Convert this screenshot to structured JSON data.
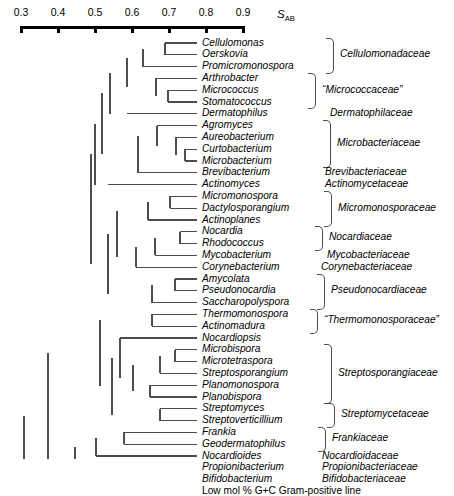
{
  "axis": {
    "label": "S",
    "label_sub": "AB",
    "ticks": [
      {
        "value": "0.3",
        "x": 21
      },
      {
        "value": "0.4",
        "x": 58
      },
      {
        "value": "0.5",
        "x": 95
      },
      {
        "value": "0.6",
        "x": 132
      },
      {
        "value": "0.7",
        "x": 169
      },
      {
        "value": "0.8",
        "x": 206
      },
      {
        "value": "0.9",
        "x": 243
      }
    ],
    "line_y": 26,
    "tick_label_y": 6
  },
  "chart_data": {
    "type": "dendrogram",
    "title": "",
    "xlabel": "S_AB",
    "xlim": [
      0.3,
      0.9
    ],
    "axis_direction": "decreasing-similarity-to-left",
    "grid": false,
    "legend": "none",
    "n_taxa": 35,
    "row_spacing": 11.8,
    "first_row_y": 43,
    "leaf_label_x": 202,
    "taxa": [
      {
        "name": "Cellulomonas",
        "row": 0,
        "branch_x": 165,
        "italic": true
      },
      {
        "name": "Oerskovia",
        "row": 1,
        "branch_x": 165,
        "italic": true
      },
      {
        "name": "Promicromonospora",
        "row": 2,
        "branch_x": 143,
        "italic": true
      },
      {
        "name": "Arthrobacter",
        "row": 3,
        "branch_x": 156,
        "italic": true
      },
      {
        "name": "Micrococcus",
        "row": 4,
        "branch_x": 168,
        "italic": true
      },
      {
        "name": "Stomatococcus",
        "row": 5,
        "branch_x": 168,
        "italic": true
      },
      {
        "name": "Dermatophilus",
        "row": 6,
        "branch_x": 127,
        "italic": true
      },
      {
        "name": "Agromyces",
        "row": 7,
        "branch_x": 157,
        "italic": true
      },
      {
        "name": "Aureobacterium",
        "row": 8,
        "branch_x": 176,
        "italic": true
      },
      {
        "name": "Curtobacterium",
        "row": 9,
        "branch_x": 185,
        "italic": true
      },
      {
        "name": "Microbacterium",
        "row": 10,
        "branch_x": 185,
        "italic": true
      },
      {
        "name": "Brevibacterium",
        "row": 11,
        "branch_x": 138,
        "italic": true
      },
      {
        "name": "Actinomyces",
        "row": 12,
        "branch_x": 108,
        "italic": true
      },
      {
        "name": "Micromonospora",
        "row": 13,
        "branch_x": 170,
        "italic": true
      },
      {
        "name": "Dactylosporangium",
        "row": 14,
        "branch_x": 170,
        "italic": true
      },
      {
        "name": "Actinoplanes",
        "row": 15,
        "branch_x": 148,
        "italic": true
      },
      {
        "name": "Nocardia",
        "row": 16,
        "branch_x": 180,
        "italic": true
      },
      {
        "name": "Rhodococcus",
        "row": 17,
        "branch_x": 180,
        "italic": true
      },
      {
        "name": "Mycobacterium",
        "row": 18,
        "branch_x": 155,
        "italic": true
      },
      {
        "name": "Corynebacterium",
        "row": 19,
        "branch_x": 136,
        "italic": true
      },
      {
        "name": "Amycolata",
        "row": 20,
        "branch_x": 175,
        "italic": true
      },
      {
        "name": "Pseudonocardia",
        "row": 21,
        "branch_x": 175,
        "italic": true
      },
      {
        "name": "Saccharopolyspora",
        "row": 22,
        "branch_x": 152,
        "italic": true
      },
      {
        "name": "Thermomonospora",
        "row": 23,
        "branch_x": 152,
        "italic": true
      },
      {
        "name": "Actinomadura",
        "row": 24,
        "branch_x": 152,
        "italic": true
      },
      {
        "name": "Nocardiopsis",
        "row": 25,
        "branch_x": 120,
        "italic": true
      },
      {
        "name": "Microbispora",
        "row": 26,
        "branch_x": 175,
        "italic": true
      },
      {
        "name": "Microtetraspora",
        "row": 27,
        "branch_x": 175,
        "italic": true
      },
      {
        "name": "Streptosporangium",
        "row": 28,
        "branch_x": 160,
        "italic": true
      },
      {
        "name": "Planomonospora",
        "row": 29,
        "branch_x": 150,
        "italic": true
      },
      {
        "name": "Planobispora",
        "row": 30,
        "branch_x": 150,
        "italic": true
      },
      {
        "name": "Streptomyces",
        "row": 31,
        "branch_x": 160,
        "italic": true
      },
      {
        "name": "Streptoverticillium",
        "row": 32,
        "branch_x": 160,
        "italic": true
      },
      {
        "name": "Frankia",
        "row": 33,
        "branch_x": 124,
        "italic": true
      },
      {
        "name": "Geodermatophilus",
        "row": 34,
        "branch_x": 124,
        "italic": true
      },
      {
        "name": "Nocardioides",
        "row": 35,
        "branch_x": 96,
        "italic": true
      },
      {
        "name": "Propionibacterium",
        "row": 36,
        "branch_x": 75,
        "italic": true
      },
      {
        "name": "Bifidobacterium",
        "row": 37,
        "branch_x": 48,
        "italic": true
      },
      {
        "name": "Low mol % G+C Gram-positive line",
        "row": 38,
        "branch_x": 24,
        "italic": false
      }
    ],
    "families": [
      {
        "label": "Cellulomonadaceae",
        "rows": [
          0,
          2
        ],
        "bracket": true,
        "quoted": false,
        "label_x": 340
      },
      {
        "label": "“Micrococcaceae”",
        "rows": [
          3,
          5
        ],
        "bracket": true,
        "quoted": true,
        "label_x": 322
      },
      {
        "label": "Dermatophilaceae",
        "rows": [
          6,
          6
        ],
        "bracket": false,
        "quoted": false,
        "label_x": 330
      },
      {
        "label": "Microbacteriaceae",
        "rows": [
          7,
          10
        ],
        "bracket": true,
        "quoted": false,
        "label_x": 337
      },
      {
        "label": "Brevibacteriaceae",
        "rows": [
          11,
          11
        ],
        "bracket": false,
        "quoted": false,
        "label_x": 325
      },
      {
        "label": "Actinomycetaceae",
        "rows": [
          12,
          12
        ],
        "bracket": false,
        "quoted": false,
        "label_x": 325
      },
      {
        "label": "Micromonosporaceae",
        "rows": [
          13,
          15
        ],
        "bracket": true,
        "quoted": false,
        "label_x": 338
      },
      {
        "label": "Nocardiaceae",
        "rows": [
          16,
          17
        ],
        "bracket": true,
        "quoted": false,
        "label_x": 329
      },
      {
        "label": "Mycobacteriaceae",
        "rows": [
          18,
          18
        ],
        "bracket": false,
        "quoted": false,
        "label_x": 327
      },
      {
        "label": "Corynebacteriaceae",
        "rows": [
          19,
          19
        ],
        "bracket": false,
        "quoted": false,
        "label_x": 321
      },
      {
        "label": "Pseudonocardiaceae",
        "rows": [
          20,
          22
        ],
        "bracket": true,
        "quoted": false,
        "label_x": 331
      },
      {
        "label": "“Thermomonosporaceae”",
        "rows": [
          23,
          24
        ],
        "bracket": true,
        "quoted": true,
        "label_x": 324
      },
      {
        "label": "Streptosporangiaceae",
        "rows": [
          26,
          30
        ],
        "bracket": true,
        "quoted": false,
        "label_x": 338
      },
      {
        "label": "Streptomycetaceae",
        "rows": [
          31,
          32
        ],
        "bracket": true,
        "quoted": false,
        "label_x": 341
      },
      {
        "label": "Frankiaceae",
        "rows": [
          33,
          34
        ],
        "bracket": true,
        "quoted": false,
        "label_x": 332
      },
      {
        "label": "Nocardioidaceae",
        "rows": [
          35,
          35
        ],
        "bracket": false,
        "quoted": false,
        "label_x": 322
      },
      {
        "label": "Propionibacteriaceae",
        "rows": [
          36,
          36
        ],
        "bracket": false,
        "quoted": false,
        "label_x": 322
      },
      {
        "label": "Bifidobacteriaceae",
        "rows": [
          37,
          37
        ],
        "bracket": false,
        "quoted": false,
        "label_x": 322
      }
    ],
    "internal_nodes": [
      {
        "x": 165,
        "rows": [
          0,
          1
        ]
      },
      {
        "x": 143,
        "rows": [
          0.5,
          2
        ]
      },
      {
        "x": 168,
        "rows": [
          4,
          5
        ]
      },
      {
        "x": 156,
        "rows": [
          3,
          4.5
        ]
      },
      {
        "x": 127,
        "rows": [
          1.25,
          3.75
        ]
      },
      {
        "x": 110,
        "rows": [
          2.5,
          6
        ]
      },
      {
        "x": 185,
        "rows": [
          9,
          10
        ]
      },
      {
        "x": 176,
        "rows": [
          8,
          9.5
        ]
      },
      {
        "x": 157,
        "rows": [
          7,
          8.75
        ]
      },
      {
        "x": 138,
        "rows": [
          7.875,
          11
        ]
      },
      {
        "x": 102,
        "rows": [
          4.25,
          9.44
        ]
      },
      {
        "x": 95,
        "rows": [
          6.84,
          12
        ]
      },
      {
        "x": 170,
        "rows": [
          13,
          14
        ]
      },
      {
        "x": 148,
        "rows": [
          13.5,
          15
        ]
      },
      {
        "x": 180,
        "rows": [
          16,
          17
        ]
      },
      {
        "x": 155,
        "rows": [
          16.5,
          18
        ]
      },
      {
        "x": 136,
        "rows": [
          17.25,
          19
        ]
      },
      {
        "x": 117,
        "rows": [
          14.25,
          18.12
        ]
      },
      {
        "x": 175,
        "rows": [
          20,
          21
        ]
      },
      {
        "x": 152,
        "rows": [
          20.5,
          22
        ]
      },
      {
        "x": 108,
        "rows": [
          16.19,
          21.25
        ]
      },
      {
        "x": 91,
        "rows": [
          9.42,
          18.72
        ]
      },
      {
        "x": 152,
        "rows": [
          23,
          24
        ]
      },
      {
        "x": 175,
        "rows": [
          26,
          27
        ]
      },
      {
        "x": 160,
        "rows": [
          26.5,
          28
        ]
      },
      {
        "x": 150,
        "rows": [
          29,
          30
        ]
      },
      {
        "x": 133,
        "rows": [
          27.25,
          29.5
        ]
      },
      {
        "x": 120,
        "rows": [
          25,
          28.37
        ]
      },
      {
        "x": 160,
        "rows": [
          31,
          32
        ]
      },
      {
        "x": 112,
        "rows": [
          26.69,
          31.5
        ]
      },
      {
        "x": 100,
        "rows": [
          23.5,
          29.09
        ]
      },
      {
        "x": 124,
        "rows": [
          33,
          34
        ]
      },
      {
        "x": 96,
        "rows": [
          33.5,
          35
        ]
      },
      {
        "x": 75,
        "rows": [
          34.25,
          36
        ]
      },
      {
        "x": 48,
        "rows": [
          26.3,
          37
        ]
      },
      {
        "x": 24,
        "rows": [
          31.65,
          38
        ]
      }
    ]
  },
  "style": {
    "line_color": "#4d4d4d",
    "axis_color": "#000000",
    "background": "#ffffff"
  }
}
